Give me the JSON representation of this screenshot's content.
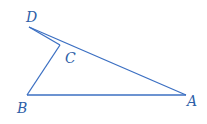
{
  "diagram": {
    "type": "geometry-figure",
    "line_color": "#3b6fc2",
    "label_color": "#2f5fa8",
    "points": {
      "A": {
        "label": "A",
        "x": 186,
        "y": 95
      },
      "B": {
        "label": "B",
        "x": 27,
        "y": 95
      },
      "C": {
        "label": "C",
        "x": 60,
        "y": 45
      },
      "D": {
        "label": "D",
        "x": 29,
        "y": 27
      }
    },
    "segments": [
      "DA",
      "AB",
      "BC",
      "CD"
    ]
  }
}
